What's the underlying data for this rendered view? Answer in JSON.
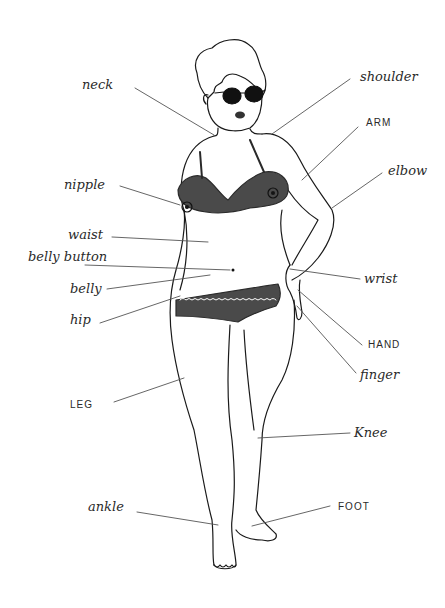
{
  "diagram": {
    "labels": {
      "neck": "neck",
      "shoulder": "shoulder",
      "arm": "ARM",
      "elbow": "elbow",
      "nipple": "nipple",
      "waist": "waist",
      "belly_button": "belly button",
      "belly": "belly",
      "hip": "hip",
      "wrist": "wrist",
      "hand": "HAND",
      "finger": "finger",
      "leg": "LEG",
      "knee": "Knee",
      "ankle": "ankle",
      "foot": "FOOT"
    },
    "colors": {
      "ink": "#1a1a1a",
      "underwear": "#4a4a4a",
      "leader_line": "#555555",
      "background": "#ffffff"
    }
  }
}
